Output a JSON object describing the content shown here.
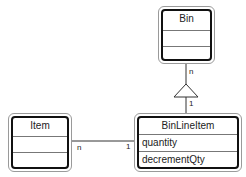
{
  "diagram": {
    "type": "UML class diagram",
    "classes": [
      {
        "name": "Bin",
        "attributes": [
          ""
        ],
        "operations": [
          ""
        ]
      },
      {
        "name": "Item",
        "attributes": [
          ""
        ],
        "operations": [
          ""
        ]
      },
      {
        "name": "BinLineItem",
        "attributes": [
          "quantity"
        ],
        "operations": [
          "decrementQty"
        ]
      }
    ],
    "relations": [
      {
        "from": "BinLineItem",
        "to": "Bin",
        "kind": "generalization-triangle",
        "to_multiplicity": "n",
        "from_multiplicity": "1"
      },
      {
        "from": "Item",
        "to": "BinLineItem",
        "kind": "association",
        "from_multiplicity": "n",
        "to_multiplicity": "1"
      }
    ]
  },
  "labels": {
    "bin_mult": "n",
    "binlineitem_up_mult": "1",
    "item_mult": "n",
    "binlineitem_left_mult": "1"
  }
}
